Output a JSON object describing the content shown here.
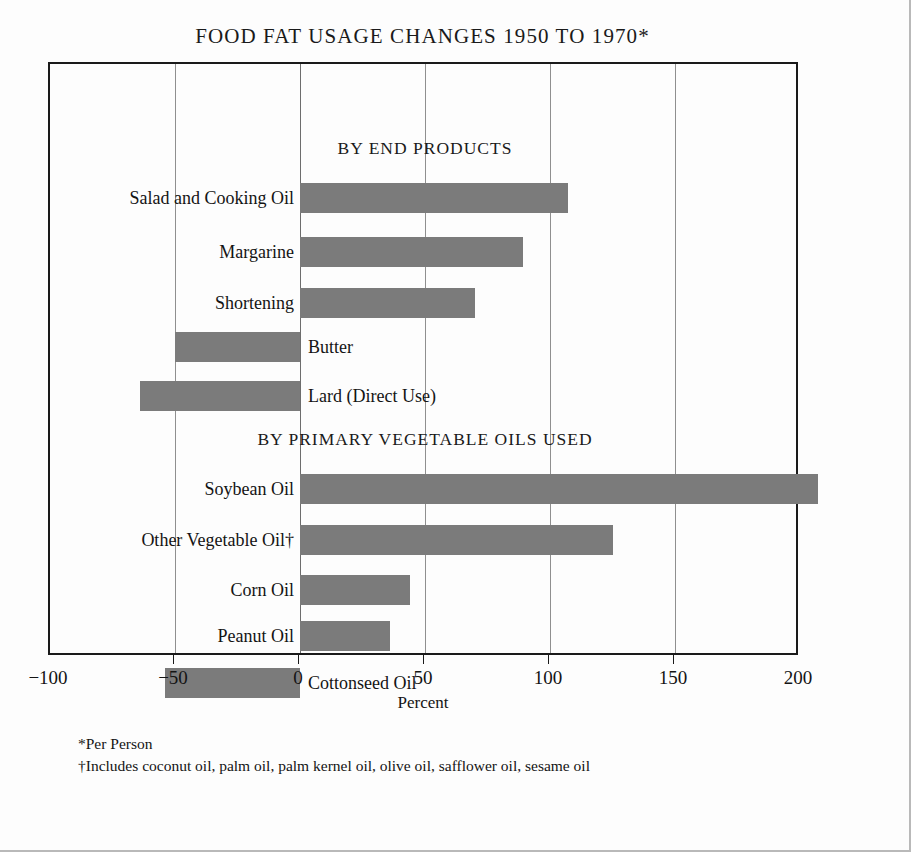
{
  "title": "FOOD FAT USAGE CHANGES 1950 TO 1970*",
  "axis_title": "Percent",
  "footnotes": [
    "*Per Person",
    "†Includes coconut oil, palm oil, palm kernel oil, olive oil, safflower oil, sesame oil"
  ],
  "sections": [
    {
      "id": "end-products",
      "header": "BY END PRODUCTS"
    },
    {
      "id": "vegetable-oils",
      "header": "BY PRIMARY VEGETABLE OILS USED"
    }
  ],
  "colors": {
    "bar": "#7b7b7b",
    "frame": "#1a1a1a",
    "grid": "#8f8f8f",
    "text": "#141414",
    "background": "#fdfdfd"
  },
  "chart_data": {
    "type": "bar",
    "orientation": "horizontal",
    "title": "FOOD FAT USAGE CHANGES 1950 TO 1970*",
    "xlabel": "Percent",
    "ylabel": "",
    "xlim": [
      -100,
      200
    ],
    "xticks": [
      -100,
      -50,
      0,
      50,
      100,
      150,
      200
    ],
    "xticklabels": [
      "−100",
      "−50",
      "0",
      "50",
      "100",
      "150",
      "200"
    ],
    "grid": true,
    "gridlines": [
      -50,
      0,
      50,
      100,
      150
    ],
    "legend": "none",
    "groups": [
      {
        "name": "BY END PRODUCTS",
        "categories": [
          "Salad and Cooking Oil",
          "Margarine",
          "Shortening",
          "Butter",
          "Lard (Direct Use)"
        ],
        "values": [
          107,
          89,
          70,
          -50,
          -64
        ]
      },
      {
        "name": "BY PRIMARY VEGETABLE OILS USED",
        "categories": [
          "Soybean Oil",
          "Other Vegetable Oil†",
          "Corn Oil",
          "Peanut Oil",
          "Cottonseed Oil"
        ],
        "values": [
          207,
          125,
          44,
          36,
          -54
        ]
      }
    ],
    "categories": [
      "Salad and Cooking Oil",
      "Margarine",
      "Shortening",
      "Butter",
      "Lard (Direct Use)",
      "Soybean Oil",
      "Other Vegetable Oil†",
      "Corn Oil",
      "Peanut Oil",
      "Cottonseed Oil"
    ],
    "values": [
      107,
      89,
      70,
      -50,
      -64,
      207,
      125,
      44,
      36,
      -54
    ]
  },
  "bars": [
    {
      "label": "Salad and Cooking Oil",
      "value": 107,
      "top": 119,
      "label_side": "left"
    },
    {
      "label": "Margarine",
      "value": 89,
      "top": 173,
      "label_side": "left"
    },
    {
      "label": "Shortening",
      "value": 70,
      "top": 224,
      "label_side": "left"
    },
    {
      "label": "Butter",
      "value": -50,
      "top": 268,
      "label_side": "right"
    },
    {
      "label": "Lard (Direct Use)",
      "value": -64,
      "top": 317,
      "label_side": "right"
    },
    {
      "label": "Soybean Oil",
      "value": 207,
      "top": 410,
      "label_side": "left"
    },
    {
      "label": "Other Vegetable Oil†",
      "value": 125,
      "top": 461,
      "label_side": "left"
    },
    {
      "label": "Corn Oil",
      "value": 44,
      "top": 511,
      "label_side": "left"
    },
    {
      "label": "Peanut Oil",
      "value": 36,
      "top": 557,
      "label_side": "left"
    },
    {
      "label": "Cottonseed Oil",
      "value": -54,
      "top": 604,
      "label_side": "right"
    }
  ],
  "section_headers": [
    {
      "text": "BY END PRODUCTS",
      "top": 74
    },
    {
      "text": "BY PRIMARY VEGETABLE OILS USED",
      "top": 365
    }
  ]
}
